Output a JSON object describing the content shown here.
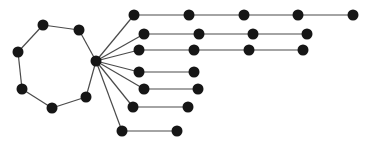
{
  "diagram": {
    "type": "graph",
    "width": 374,
    "height": 144,
    "colors": {
      "node": "#161616",
      "edge": "#4a4a4a",
      "background": "#ffffff"
    },
    "node_radius": 5.5,
    "nodes": [
      {
        "id": "hub",
        "x": 96,
        "y": 61
      },
      {
        "id": "c1",
        "x": 43,
        "y": 25
      },
      {
        "id": "c2",
        "x": 79,
        "y": 30
      },
      {
        "id": "c3",
        "x": 86,
        "y": 97
      },
      {
        "id": "c4",
        "x": 52,
        "y": 108
      },
      {
        "id": "c5",
        "x": 22,
        "y": 89
      },
      {
        "id": "c6",
        "x": 18,
        "y": 52
      },
      {
        "id": "a1",
        "x": 134,
        "y": 15
      },
      {
        "id": "a2",
        "x": 189,
        "y": 15
      },
      {
        "id": "a3",
        "x": 244,
        "y": 15
      },
      {
        "id": "a4",
        "x": 298,
        "y": 15
      },
      {
        "id": "a5",
        "x": 353,
        "y": 15
      },
      {
        "id": "b1",
        "x": 144,
        "y": 34
      },
      {
        "id": "b2",
        "x": 199,
        "y": 34
      },
      {
        "id": "b3",
        "x": 253,
        "y": 34
      },
      {
        "id": "b4",
        "x": 307,
        "y": 34
      },
      {
        "id": "d1",
        "x": 139,
        "y": 50
      },
      {
        "id": "d2",
        "x": 194,
        "y": 50
      },
      {
        "id": "d3",
        "x": 249,
        "y": 50
      },
      {
        "id": "d4",
        "x": 303,
        "y": 50
      },
      {
        "id": "e1",
        "x": 139,
        "y": 72
      },
      {
        "id": "e2",
        "x": 194,
        "y": 72
      },
      {
        "id": "f1",
        "x": 144,
        "y": 89
      },
      {
        "id": "f2",
        "x": 198,
        "y": 89
      },
      {
        "id": "g1",
        "x": 133,
        "y": 107
      },
      {
        "id": "g2",
        "x": 188,
        "y": 107
      },
      {
        "id": "h1",
        "x": 122,
        "y": 131
      },
      {
        "id": "h2",
        "x": 177,
        "y": 131
      }
    ],
    "edges": [
      [
        "hub",
        "c2"
      ],
      [
        "c2",
        "c1"
      ],
      [
        "c1",
        "c6"
      ],
      [
        "c6",
        "c5"
      ],
      [
        "c5",
        "c4"
      ],
      [
        "c4",
        "c3"
      ],
      [
        "c3",
        "hub"
      ],
      [
        "hub",
        "a1"
      ],
      [
        "a1",
        "a2"
      ],
      [
        "a2",
        "a3"
      ],
      [
        "a3",
        "a4"
      ],
      [
        "a4",
        "a5"
      ],
      [
        "hub",
        "b1"
      ],
      [
        "b1",
        "b2"
      ],
      [
        "b2",
        "b3"
      ],
      [
        "b3",
        "b4"
      ],
      [
        "hub",
        "d1"
      ],
      [
        "d1",
        "d2"
      ],
      [
        "d2",
        "d3"
      ],
      [
        "d3",
        "d4"
      ],
      [
        "hub",
        "e1"
      ],
      [
        "e1",
        "e2"
      ],
      [
        "hub",
        "f1"
      ],
      [
        "f1",
        "f2"
      ],
      [
        "hub",
        "g1"
      ],
      [
        "g1",
        "g2"
      ],
      [
        "hub",
        "h1"
      ],
      [
        "h1",
        "h2"
      ]
    ]
  }
}
